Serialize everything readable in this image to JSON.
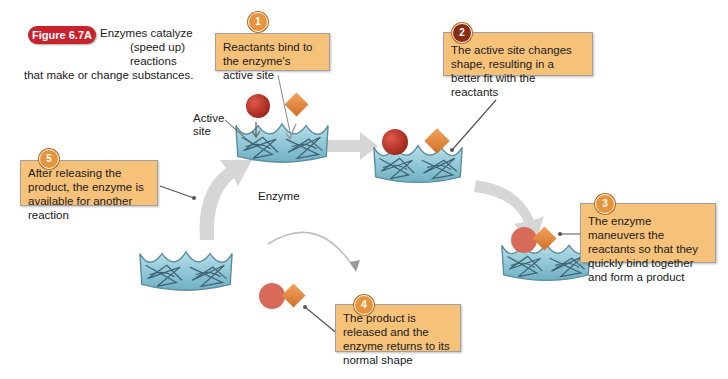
{
  "figure": {
    "badge": "Figure 6.7A",
    "caption_line1": "Enzymes catalyze",
    "caption_line2": "(speed up) reactions",
    "caption_line3": "that make or change substances."
  },
  "labels": {
    "active_site_1": "Active",
    "active_site_2": "site",
    "enzyme": "Enzyme"
  },
  "steps": [
    {
      "number": "1",
      "text": "Reactants bind to the enzyme's active site"
    },
    {
      "number": "2",
      "text": "The active site changes shape, resulting in a better fit with the reactants"
    },
    {
      "number": "3",
      "text": "The enzyme maneuvers the reactants so that they quickly bind together and form a product"
    },
    {
      "number": "4",
      "text": "The product is released and the enzyme returns to its normal shape"
    },
    {
      "number": "5",
      "text": "After releasing the product, the enzyme is available for another reaction"
    }
  ],
  "colors": {
    "callout_fill": "#f6c27a",
    "badge_red": "#c8232c",
    "reactant_circle": "#c0392b",
    "reactant_diamond": "#e8873a",
    "enzyme_fill": "#8fc9d9",
    "arrow_gray": "#cfcfcf"
  }
}
